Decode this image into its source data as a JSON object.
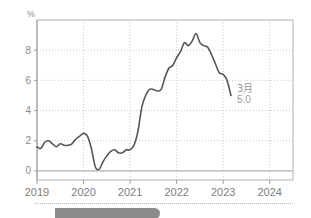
{
  "chart_data": {
    "type": "line",
    "title": "",
    "subtitle": "",
    "xlabel": "",
    "ylabel": "",
    "y_unit_label": "%",
    "ylim": [
      -0.6,
      10.0
    ],
    "yticks": [
      0,
      2,
      4,
      6,
      8
    ],
    "ytick_labels": [
      "0",
      "2",
      "4",
      "6",
      "8"
    ],
    "xlim": [
      2019.0,
      2024.5
    ],
    "xticks": [
      2019,
      2020,
      2021,
      2022,
      2023,
      2024
    ],
    "xtick_labels": [
      "2019",
      "2020",
      "2021",
      "2022",
      "2023",
      "2024"
    ],
    "grid": true,
    "grid_style": "dotted",
    "legend": "none",
    "zero_line": true,
    "line_color": "#555555",
    "grid_color": "#c9c9c9",
    "axis_color": "#9e9e9e",
    "series": [
      {
        "name": "inflation-rate",
        "x": [
          2019.0,
          2019.083,
          2019.167,
          2019.25,
          2019.333,
          2019.417,
          2019.5,
          2019.583,
          2019.667,
          2019.75,
          2019.833,
          2019.917,
          2020.0,
          2020.083,
          2020.167,
          2020.25,
          2020.333,
          2020.417,
          2020.5,
          2020.583,
          2020.667,
          2020.75,
          2020.833,
          2020.917,
          2021.0,
          2021.083,
          2021.167,
          2021.25,
          2021.333,
          2021.417,
          2021.5,
          2021.583,
          2021.667,
          2021.75,
          2021.833,
          2021.917,
          2022.0,
          2022.083,
          2022.167,
          2022.25,
          2022.333,
          2022.417,
          2022.5,
          2022.583,
          2022.667,
          2022.75,
          2022.833,
          2022.917,
          2023.0,
          2023.083,
          2023.167
        ],
        "values": [
          1.6,
          1.5,
          1.9,
          2.0,
          1.8,
          1.6,
          1.8,
          1.7,
          1.7,
          1.8,
          2.1,
          2.3,
          2.5,
          2.3,
          1.5,
          0.3,
          0.1,
          0.6,
          1.0,
          1.3,
          1.4,
          1.2,
          1.2,
          1.4,
          1.4,
          1.7,
          2.6,
          4.2,
          5.0,
          5.4,
          5.4,
          5.3,
          5.4,
          6.2,
          6.8,
          7.0,
          7.5,
          7.9,
          8.5,
          8.3,
          8.6,
          9.1,
          8.5,
          8.3,
          8.2,
          7.7,
          7.1,
          6.5,
          6.4,
          6.0,
          5.0
        ]
      }
    ],
    "annotations": [
      {
        "name": "last-point-callout",
        "lines": [
          "3月",
          "5.0"
        ],
        "x": 2023.167,
        "y": 5.0
      }
    ]
  },
  "footer": {
    "pill_label": ""
  }
}
